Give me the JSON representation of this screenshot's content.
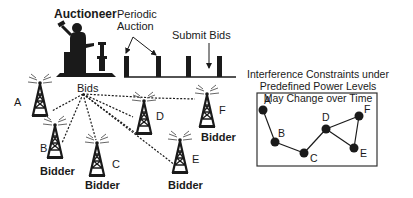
{
  "auction": {
    "auctioneer_label": "Auctioneer",
    "periodic_label_line1": "Periodic",
    "periodic_label_line2": "Auction",
    "submit_label": "Submit Bids"
  },
  "network": {
    "bids_label": "Bids",
    "towers": [
      {
        "id": "A",
        "label": "A",
        "bidder_label": ""
      },
      {
        "id": "B",
        "label": "B",
        "bidder_label": "Bidder"
      },
      {
        "id": "C",
        "label": "C",
        "bidder_label": "Bidder"
      },
      {
        "id": "D",
        "label": "D",
        "bidder_label": ""
      },
      {
        "id": "E",
        "label": "E",
        "bidder_label": "Bidder"
      },
      {
        "id": "F",
        "label": "F",
        "bidder_label": "Bidder"
      }
    ]
  },
  "graph": {
    "title_line1": "Interference Constraints under",
    "title_line2": "Predefined Power Levels",
    "title_line3": "May Change over Time",
    "nodes": [
      {
        "id": "A",
        "label": "A"
      },
      {
        "id": "B",
        "label": "B"
      },
      {
        "id": "C",
        "label": "C"
      },
      {
        "id": "D",
        "label": "D"
      },
      {
        "id": "E",
        "label": "E"
      },
      {
        "id": "F",
        "label": "F"
      }
    ],
    "edges": [
      [
        "A",
        "B"
      ],
      [
        "B",
        "C"
      ],
      [
        "C",
        "D"
      ],
      [
        "D",
        "E"
      ],
      [
        "D",
        "F"
      ],
      [
        "E",
        "F"
      ]
    ]
  },
  "colors": {
    "ink": "#1a1a1a",
    "background": "#ffffff"
  }
}
